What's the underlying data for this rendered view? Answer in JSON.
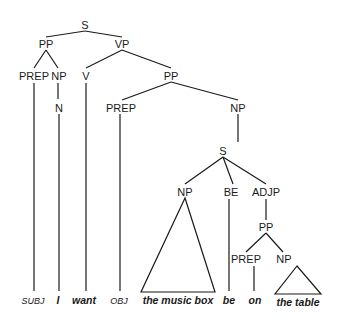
{
  "diagram": {
    "type": "syntax-tree",
    "nodes": {
      "s_root": "S",
      "pp_top": "PP",
      "vp": "VP",
      "prep_1": "PREP",
      "np_1": "NP",
      "v": "V",
      "pp_2": "PP",
      "n": "N",
      "prep_2": "PREP",
      "np_2": "NP",
      "s_embedded": "S",
      "np_3": "NP",
      "be": "BE",
      "adjp": "ADJP",
      "pp_3": "PP",
      "prep_3": "PREP",
      "np_4": "NP"
    },
    "leaves": {
      "subj": "SUBJ",
      "i": "I",
      "want": "want",
      "obj": "OBJ",
      "the_music_box": "the music box",
      "be": "be",
      "on": "on",
      "the_table": "the table"
    }
  }
}
